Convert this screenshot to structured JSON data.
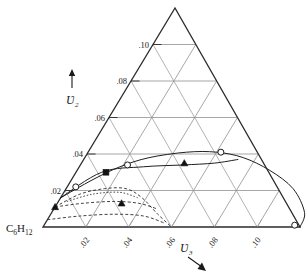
{
  "figure": {
    "type": "ternary-phase-diagram",
    "background": "#ffffff",
    "ink_color": "#1a1a1a"
  },
  "corner_label": {
    "base": "C",
    "sub1": "6",
    "element": "H",
    "sub2": "12",
    "full": "C6H12",
    "name": "cyclohexane-corner-label"
  },
  "left_axis": {
    "symbol": "Ʋ",
    "subscript": "2",
    "arrow": "↑",
    "ticks": [
      ".02",
      ".04",
      ".06",
      ".08",
      ".10"
    ],
    "values": [
      0.02,
      0.04,
      0.06,
      0.08,
      0.1
    ]
  },
  "bottom_axis": {
    "symbol": "Ʋ",
    "subscript": "3",
    "arrow": "↘",
    "ticks": [
      ".02",
      ".04",
      ".06",
      ".08",
      ".10"
    ],
    "values": [
      0.02,
      0.04,
      0.06,
      0.08,
      0.1
    ]
  },
  "chart_data": {
    "type": "line",
    "title": "",
    "subtitle": "",
    "xlabel": "v3",
    "ylabel": "v2",
    "xlim": [
      0,
      0.12
    ],
    "ylim": [
      0,
      0.12
    ],
    "grid": true,
    "legend": "none",
    "annotations": [
      "C6H12"
    ],
    "series": [
      {
        "name": "binodal-upper-solid",
        "style": "solid",
        "x": [
          0.0,
          0.01,
          0.019,
          0.03,
          0.046,
          0.06,
          0.074,
          0.09,
          0.106,
          0.118,
          0.12
        ],
        "y": [
          0.016,
          0.026,
          0.033,
          0.038,
          0.041,
          0.041,
          0.038,
          0.031,
          0.021,
          0.008,
          0.0
        ]
      },
      {
        "name": "tie-line-solid",
        "style": "solid",
        "x": [
          0.0,
          0.012,
          0.03,
          0.048,
          0.062,
          0.072
        ],
        "y": [
          0.016,
          0.03,
          0.033,
          0.034,
          0.035,
          0.037
        ]
      },
      {
        "name": "binodal-lower-dashed",
        "style": "dashed",
        "x": [
          0.0,
          0.008,
          0.018,
          0.028,
          0.038,
          0.05,
          0.06
        ],
        "y": [
          0.011,
          0.018,
          0.021,
          0.021,
          0.016,
          0.007,
          0.0
        ]
      },
      {
        "name": "tie-line-dashed-upper",
        "style": "dashed",
        "x": [
          0.0,
          0.012,
          0.026,
          0.038,
          0.048
        ],
        "y": [
          0.011,
          0.013,
          0.014,
          0.013,
          0.01
        ]
      },
      {
        "name": "tie-line-dashed-lower",
        "style": "dashed",
        "x": [
          0.0,
          0.014,
          0.03,
          0.044,
          0.056
        ],
        "y": [
          0.004,
          0.006,
          0.007,
          0.006,
          0.002
        ]
      },
      {
        "name": "dotted-inner",
        "style": "dotted",
        "x": [
          0.004,
          0.014,
          0.026,
          0.036
        ],
        "y": [
          0.014,
          0.018,
          0.019,
          0.016
        ]
      }
    ],
    "markers": [
      {
        "name": "open-circle-1",
        "shape": "circle-open",
        "x": 0.004,
        "y": 0.022
      },
      {
        "name": "open-circle-2",
        "shape": "circle-open",
        "x": 0.022,
        "y": 0.034
      },
      {
        "name": "open-circle-3",
        "shape": "circle-open",
        "x": 0.062,
        "y": 0.041
      },
      {
        "name": "open-circle-4",
        "shape": "circle-open",
        "x": 0.117,
        "y": 0.001
      },
      {
        "name": "filled-square-1",
        "shape": "square-filled",
        "x": 0.014,
        "y": 0.03
      },
      {
        "name": "filled-triangle-1",
        "shape": "triangle-filled",
        "x": 0.048,
        "y": 0.035
      },
      {
        "name": "filled-triangle-2",
        "shape": "triangle-filled",
        "x": 0.0,
        "y": 0.011
      },
      {
        "name": "filled-triangle-3",
        "shape": "triangle-filled",
        "x": 0.03,
        "y": 0.013
      }
    ]
  }
}
